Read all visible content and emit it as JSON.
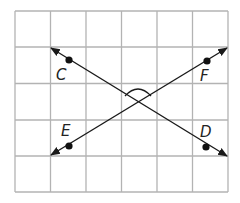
{
  "diagram": {
    "type": "intersecting-lines-on-grid",
    "grid": {
      "columns": 6,
      "rows": 5,
      "color": "#b3b3b3"
    },
    "lines": [
      {
        "name": "line-CD",
        "through": [
          "C",
          "D"
        ],
        "bidirectional_arrows": true
      },
      {
        "name": "line-EF",
        "through": [
          "E",
          "F"
        ],
        "bidirectional_arrows": true
      }
    ],
    "points": [
      {
        "label": "C"
      },
      {
        "label": "F"
      },
      {
        "label": "E"
      },
      {
        "label": "D"
      }
    ],
    "angle_marker": {
      "position": "top angle at intersection"
    },
    "line_color": "#1a1a1a"
  }
}
